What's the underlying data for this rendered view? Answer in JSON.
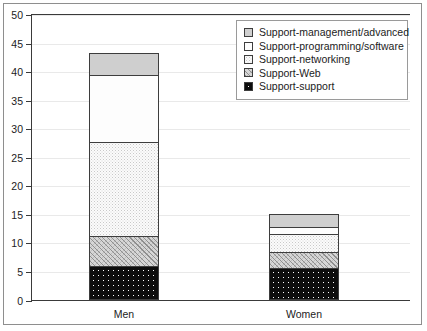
{
  "chart_data": {
    "type": "bar",
    "subtype": "stacked-bar",
    "title": "",
    "xlabel": "",
    "ylabel": "",
    "categories": [
      "Men",
      "Women"
    ],
    "ylim": [
      0,
      50
    ],
    "yticks": [
      0,
      5,
      10,
      15,
      20,
      25,
      30,
      35,
      40,
      45,
      50
    ],
    "ytick_labels": [
      "0",
      "5",
      "10",
      "15",
      "20",
      "25",
      "30",
      "35",
      "40",
      "45",
      "50"
    ],
    "grid": true,
    "grid_axis": "y",
    "legend_position": "upper-right",
    "stack_order_bottom_to_top": [
      "Support-support",
      "Support-Web",
      "Support-networking",
      "Support-programming/software",
      "Support-management/advanced"
    ],
    "series": [
      {
        "name": "Support-support",
        "pattern": "black-dotted",
        "color": "#0d0d0d",
        "values": [
          6.0,
          5.5
        ]
      },
      {
        "name": "Support-Web",
        "pattern": "diagonal-crosshatch",
        "color": "#d6d6d6",
        "values": [
          5.3,
          3.0
        ]
      },
      {
        "name": "Support-networking",
        "pattern": "fine-stipple",
        "color": "#fbfbfb",
        "values": [
          16.7,
          3.5
        ]
      },
      {
        "name": "Support-programming/software",
        "pattern": "empty-white",
        "color": "#fdfdfd",
        "values": [
          12.0,
          1.3
        ]
      },
      {
        "name": "Support-management/advanced",
        "pattern": "solid-gray",
        "color": "#cfcfcf",
        "values": [
          4.0,
          2.5
        ]
      }
    ],
    "totals": [
      44.0,
      15.8
    ],
    "cumulative_tops": {
      "Men": [
        6.0,
        11.3,
        28.0,
        40.0,
        44.0
      ],
      "Women": [
        5.5,
        8.5,
        12.0,
        13.3,
        15.8
      ]
    }
  },
  "legend": {
    "items": [
      {
        "label": "Support-management/advanced",
        "swatch": "solid-gray"
      },
      {
        "label": "Support-programming/software",
        "swatch": "empty-white"
      },
      {
        "label": "Support-networking",
        "swatch": "fine-stipple"
      },
      {
        "label": "Support-Web",
        "swatch": "diagonal-crosshatch"
      },
      {
        "label": "Support-support",
        "swatch": "black-dotted"
      }
    ]
  },
  "axis": {
    "y_labels": [
      "50",
      "45",
      "40",
      "35",
      "30",
      "25",
      "20",
      "15",
      "10",
      "5",
      "0"
    ],
    "x_labels": [
      "Men",
      "Women"
    ]
  }
}
